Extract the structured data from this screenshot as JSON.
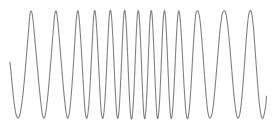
{
  "figure": {
    "title": "",
    "background_color": "#ffffff",
    "width_px": 272,
    "height_px": 129
  },
  "chart_data": {
    "type": "line",
    "title": "",
    "subtitle": "",
    "xlabel": "",
    "ylabel": "",
    "series_name": "chirp-waveform",
    "line_color": "#808080",
    "line_width_px": 1.1,
    "grid": false,
    "axes_visible": false,
    "legend": null,
    "legend_position": "none",
    "xlim": [
      0,
      272
    ],
    "ylim": [
      129,
      0
    ],
    "baseline_y_px": 64.5,
    "peak_y_px": 11,
    "trough_y_px": 118,
    "amplitude_px": 53.5,
    "start_x_px": 10,
    "end_x_px": 266,
    "start_y_px": 62,
    "end_y_px": 65,
    "cycle_count": 13,
    "peak_x_positions": [
      30,
      55,
      76,
      93,
      108,
      124,
      137,
      149,
      161,
      177,
      200,
      225,
      245,
      265
    ],
    "trough_x_positions": [
      18,
      43,
      66,
      85,
      101,
      116,
      131,
      143,
      155,
      168,
      188,
      212,
      236,
      255
    ],
    "points": [
      [
        10,
        62
      ],
      [
        11,
        72
      ],
      [
        12,
        83
      ],
      [
        13,
        93
      ],
      [
        14,
        102
      ],
      [
        15,
        109
      ],
      [
        16,
        114
      ],
      [
        17,
        117
      ],
      [
        18,
        118
      ],
      [
        19,
        117
      ],
      [
        20,
        114
      ],
      [
        21,
        109
      ],
      [
        22,
        102
      ],
      [
        23,
        94
      ],
      [
        24,
        84
      ],
      [
        25,
        73
      ],
      [
        26,
        61
      ],
      [
        27,
        49
      ],
      [
        28,
        37
      ],
      [
        29,
        25
      ],
      [
        30,
        14
      ],
      [
        31,
        11
      ],
      [
        32,
        13
      ],
      [
        33,
        20
      ],
      [
        34,
        30
      ],
      [
        35,
        41
      ],
      [
        36,
        52
      ],
      [
        37,
        63
      ],
      [
        38,
        74
      ],
      [
        39,
        85
      ],
      [
        40,
        95
      ],
      [
        41,
        104
      ],
      [
        42,
        112
      ],
      [
        43,
        117
      ],
      [
        44,
        118
      ],
      [
        45,
        116
      ],
      [
        46,
        111
      ],
      [
        47,
        103
      ],
      [
        48,
        94
      ],
      [
        49,
        83
      ],
      [
        50,
        71
      ],
      [
        51,
        59
      ],
      [
        52,
        46
      ],
      [
        53,
        34
      ],
      [
        54,
        22
      ],
      [
        55,
        13
      ],
      [
        56,
        11
      ],
      [
        57,
        15
      ],
      [
        58,
        24
      ],
      [
        59,
        35
      ],
      [
        60,
        47
      ],
      [
        61,
        59
      ],
      [
        62,
        71
      ],
      [
        63,
        83
      ],
      [
        64,
        94
      ],
      [
        65,
        104
      ],
      [
        66,
        112
      ],
      [
        67,
        117
      ],
      [
        68,
        118
      ],
      [
        69,
        115
      ],
      [
        70,
        108
      ],
      [
        71,
        98
      ],
      [
        72,
        85
      ],
      [
        73,
        71
      ],
      [
        74,
        55
      ],
      [
        75,
        38
      ],
      [
        76,
        23
      ],
      [
        77,
        13
      ],
      [
        78,
        11
      ],
      [
        79,
        17
      ],
      [
        80,
        29
      ],
      [
        81,
        44
      ],
      [
        82,
        61
      ],
      [
        83,
        79
      ],
      [
        84,
        96
      ],
      [
        85,
        110
      ],
      [
        86,
        117
      ],
      [
        87,
        118
      ],
      [
        88,
        113
      ],
      [
        89,
        102
      ],
      [
        90,
        87
      ],
      [
        91,
        68
      ],
      [
        92,
        47
      ],
      [
        93,
        27
      ],
      [
        94,
        13
      ],
      [
        95,
        11
      ],
      [
        96,
        19
      ],
      [
        97,
        34
      ],
      [
        98,
        53
      ],
      [
        99,
        73
      ],
      [
        100,
        93
      ],
      [
        101,
        109
      ],
      [
        102,
        117
      ],
      [
        103,
        118
      ],
      [
        104,
        112
      ],
      [
        105,
        99
      ],
      [
        106,
        81
      ],
      [
        107,
        60
      ],
      [
        108,
        38
      ],
      [
        109,
        20
      ],
      [
        110,
        11
      ],
      [
        111,
        12
      ],
      [
        112,
        23
      ],
      [
        113,
        41
      ],
      [
        114,
        63
      ],
      [
        115,
        85
      ],
      [
        116,
        104
      ],
      [
        117,
        116
      ],
      [
        118,
        118
      ],
      [
        119,
        111
      ],
      [
        120,
        95
      ],
      [
        121,
        74
      ],
      [
        122,
        51
      ],
      [
        123,
        28
      ],
      [
        124,
        13
      ],
      [
        125,
        11
      ],
      [
        126,
        21
      ],
      [
        127,
        40
      ],
      [
        128,
        64
      ],
      [
        129,
        88
      ],
      [
        130,
        107
      ],
      [
        131,
        118
      ],
      [
        132,
        118
      ],
      [
        133,
        108
      ],
      [
        134,
        90
      ],
      [
        135,
        66
      ],
      [
        136,
        41
      ],
      [
        137,
        20
      ],
      [
        138,
        11
      ],
      [
        139,
        14
      ],
      [
        140,
        29
      ],
      [
        141,
        52
      ],
      [
        142,
        78
      ],
      [
        143,
        101
      ],
      [
        144,
        116
      ],
      [
        145,
        118
      ],
      [
        146,
        109
      ],
      [
        147,
        91
      ],
      [
        148,
        67
      ],
      [
        149,
        41
      ],
      [
        150,
        20
      ],
      [
        151,
        11
      ],
      [
        152,
        14
      ],
      [
        153,
        30
      ],
      [
        154,
        53
      ],
      [
        155,
        79
      ],
      [
        156,
        101
      ],
      [
        157,
        116
      ],
      [
        158,
        118
      ],
      [
        159,
        110
      ],
      [
        160,
        93
      ],
      [
        161,
        70
      ],
      [
        162,
        45
      ],
      [
        163,
        23
      ],
      [
        164,
        12
      ],
      [
        165,
        12
      ],
      [
        166,
        25
      ],
      [
        167,
        45
      ],
      [
        168,
        69
      ],
      [
        169,
        92
      ],
      [
        170,
        110
      ],
      [
        171,
        118
      ],
      [
        172,
        116
      ],
      [
        173,
        105
      ],
      [
        174,
        88
      ],
      [
        175,
        67
      ],
      [
        176,
        45
      ],
      [
        177,
        26
      ],
      [
        178,
        14
      ],
      [
        179,
        11
      ],
      [
        180,
        17
      ],
      [
        181,
        30
      ],
      [
        182,
        47
      ],
      [
        183,
        66
      ],
      [
        184,
        85
      ],
      [
        185,
        101
      ],
      [
        186,
        113
      ],
      [
        187,
        118
      ],
      [
        188,
        118
      ],
      [
        189,
        112
      ],
      [
        190,
        101
      ],
      [
        191,
        86
      ],
      [
        192,
        69
      ],
      [
        193,
        51
      ],
      [
        194,
        35
      ],
      [
        195,
        22
      ],
      [
        196,
        13
      ],
      [
        197,
        11
      ],
      [
        198,
        11
      ],
      [
        199,
        14
      ],
      [
        200,
        20
      ],
      [
        201,
        30
      ],
      [
        202,
        42
      ],
      [
        203,
        55
      ],
      [
        204,
        69
      ],
      [
        205,
        82
      ],
      [
        206,
        94
      ],
      [
        207,
        105
      ],
      [
        208,
        113
      ],
      [
        209,
        117
      ],
      [
        210,
        118
      ],
      [
        211,
        117
      ],
      [
        212,
        114
      ],
      [
        213,
        108
      ],
      [
        214,
        99
      ],
      [
        215,
        89
      ],
      [
        216,
        77
      ],
      [
        217,
        65
      ],
      [
        218,
        53
      ],
      [
        219,
        41
      ],
      [
        220,
        30
      ],
      [
        221,
        22
      ],
      [
        222,
        15
      ],
      [
        223,
        12
      ],
      [
        224,
        11
      ],
      [
        225,
        11
      ],
      [
        226,
        14
      ],
      [
        227,
        20
      ],
      [
        228,
        28
      ],
      [
        229,
        38
      ],
      [
        230,
        49
      ],
      [
        231,
        61
      ],
      [
        232,
        73
      ],
      [
        233,
        85
      ],
      [
        234,
        96
      ],
      [
        235,
        105
      ],
      [
        236,
        112
      ],
      [
        237,
        117
      ],
      [
        238,
        118
      ],
      [
        239,
        117
      ],
      [
        240,
        113
      ],
      [
        241,
        106
      ],
      [
        242,
        96
      ],
      [
        243,
        84
      ],
      [
        244,
        71
      ],
      [
        245,
        57
      ],
      [
        246,
        43
      ],
      [
        247,
        30
      ],
      [
        248,
        20
      ],
      [
        249,
        13
      ],
      [
        250,
        11
      ],
      [
        251,
        11
      ],
      [
        252,
        15
      ],
      [
        253,
        23
      ],
      [
        254,
        34
      ],
      [
        255,
        48
      ],
      [
        256,
        62
      ],
      [
        257,
        76
      ],
      [
        258,
        89
      ],
      [
        259,
        100
      ],
      [
        260,
        109
      ],
      [
        261,
        115
      ],
      [
        262,
        118
      ],
      [
        263,
        118
      ],
      [
        264,
        115
      ],
      [
        265,
        110
      ],
      [
        266,
        103
      ],
      [
        266.5,
        96
      ]
    ]
  }
}
